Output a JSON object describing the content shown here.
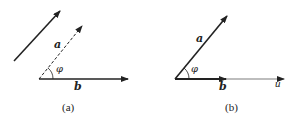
{
  "panels": [
    {
      "id": "a",
      "caption": "(a)",
      "labels": {
        "vector_a": "a",
        "vector_b": "b",
        "angle": "φ"
      }
    },
    {
      "id": "b",
      "caption": "(b)",
      "labels": {
        "vector_a": "a",
        "vector_b": "b",
        "angle": "φ",
        "axis": "u"
      }
    }
  ],
  "colors": {
    "stroke": "#222222",
    "background": "#ffffff"
  }
}
